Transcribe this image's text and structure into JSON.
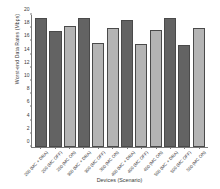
{
  "chart_data": {
    "type": "bar",
    "title": "",
    "xlabel": "Devices (Scenario)",
    "ylabel": "Worst-end Data Rates (Mbps)",
    "ylim": [
      0,
      20
    ],
    "yticks": [
      0,
      2,
      4,
      6,
      8,
      10,
      12,
      14,
      16,
      18,
      20
    ],
    "grid": false,
    "legend": "none",
    "categories": [
      "200 (MC + DRA)",
      "200 (MC OFF)",
      "200 (MC ON)",
      "300 (MC + DRA)",
      "300 (MC OFF)",
      "300 (MC ON)",
      "400 (MC + DRA)",
      "400 (MC OFF)",
      "400 (MC ON)",
      "500 (MC + DRA)",
      "500 (MC OFF)",
      "500 (MC ON)"
    ],
    "values": [
      19.6,
      17.6,
      18.3,
      19.6,
      15.7,
      18.0,
      19.2,
      15.6,
      17.8,
      19.5,
      15.5,
      18.0
    ],
    "bar_colors": [
      "#636363",
      "#636363",
      "#b4b4b4",
      "#636363",
      "#b4b4b4",
      "#b4b4b4",
      "#636363",
      "#b4b4b4",
      "#b4b4b4",
      "#636363",
      "#636363",
      "#b4b4b4"
    ],
    "colors": {
      "dark": "#636363",
      "light": "#b4b4b4",
      "axis": "#7a7a7a",
      "text": "#3a3a3a",
      "background": "#ffffff"
    }
  }
}
